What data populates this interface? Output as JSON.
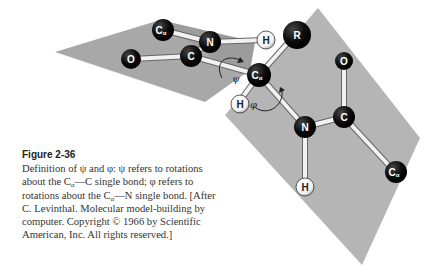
{
  "figure": {
    "title": "Figure 2-36",
    "caption_parts": {
      "p1": "Definition of ψ and φ: ψ refers to rotations about the C",
      "alpha1": "α",
      "p2": "—C single bond; φ refers to rotations about the C",
      "alpha2": "α",
      "p3": "—N single bond. [After C. Levinthal. Molecular model-building by computer. Copyright © 1966 by Scientific American, Inc. All rights reserved.]"
    }
  },
  "diagram": {
    "atoms": {
      "ca_left": {
        "label": "C",
        "sub": "α"
      },
      "n_left": {
        "label": "N"
      },
      "h_top": {
        "label": "H"
      },
      "o_left": {
        "label": "O"
      },
      "c_left": {
        "label": "C"
      },
      "r": {
        "label": "R"
      },
      "ca_center": {
        "label": "C",
        "sub": "α"
      },
      "h_center": {
        "label": "H"
      },
      "n_right": {
        "label": "N"
      },
      "h_bottom": {
        "label": "H"
      },
      "c_right": {
        "label": "C"
      },
      "o_right": {
        "label": "O"
      },
      "ca_right": {
        "label": "C",
        "sub": "α"
      }
    },
    "angles": {
      "psi": "ψ",
      "phi": "φ"
    },
    "colors": {
      "plane": "#b3b3b3",
      "plane_dark": "#9a9a9a",
      "atom_dark": "#111111",
      "atom_light": "#ffffff",
      "bond": "#eeeeee"
    }
  }
}
